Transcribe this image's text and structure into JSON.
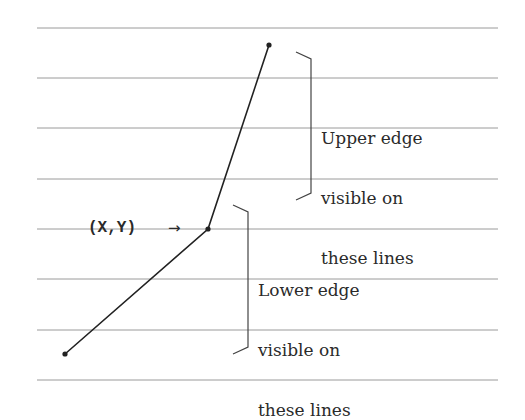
{
  "diagram": {
    "type": "ruled-lines-polyline",
    "ruled_lines": {
      "count": 8,
      "x_start": 37,
      "x_end": 498,
      "y_positions": [
        28,
        78,
        128,
        179,
        229,
        279,
        330,
        380
      ],
      "color": "#9a9a9a"
    },
    "polyline": {
      "color": "#222222",
      "points": [
        {
          "name": "top-endpoint",
          "x": 269,
          "y": 45
        },
        {
          "name": "vertex",
          "x": 208,
          "y": 229
        },
        {
          "name": "bottom-endpoint",
          "x": 65,
          "y": 354
        }
      ]
    },
    "vertex_label": {
      "text": "(X,Y)",
      "arrow": "→"
    },
    "upper_bracket": {
      "x": 311,
      "y_top": 52,
      "y_bottom": 200,
      "label_lines": [
        "Upper edge",
        "visible on",
        "these lines"
      ]
    },
    "lower_bracket": {
      "x": 248,
      "y_top": 205,
      "y_bottom": 354,
      "label_lines": [
        "Lower edge",
        "visible on",
        "these lines"
      ]
    }
  }
}
